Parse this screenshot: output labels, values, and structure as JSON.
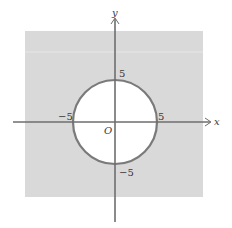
{
  "figure": {
    "axes": {
      "x_label": "x",
      "y_label": "y",
      "origin_label": "O"
    },
    "ticks": {
      "x_pos": "5",
      "x_neg": "−5",
      "y_pos": "5",
      "y_neg": "−5"
    },
    "circle": {
      "center": [
        0,
        0
      ],
      "radius": 5
    },
    "colors": {
      "shade": "#d9d9d9",
      "circle_stroke": "#7a7a7a",
      "axis": "#6e6e6e",
      "background": "#ffffff"
    }
  }
}
